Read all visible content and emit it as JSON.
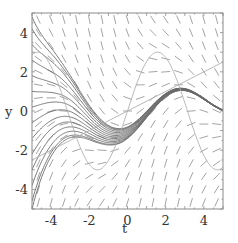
{
  "chart_data": {
    "type": "line",
    "title": "",
    "subtitle": "Direction field with solution curves",
    "xlabel": "t",
    "ylabel": "y",
    "xlim": [
      -5,
      5
    ],
    "ylim": [
      -5,
      5
    ],
    "x_ticks": [
      -4,
      -2,
      0,
      2,
      4
    ],
    "y_ticks": [
      -4,
      -2,
      0,
      2,
      4
    ],
    "x_tick_labels": [
      "-4",
      "-2",
      "0",
      "2",
      "4"
    ],
    "y_tick_labels": [
      "-4",
      "-2",
      "0",
      "2",
      "4"
    ],
    "grid": false,
    "legend": null,
    "series": [
      {
        "name": "line y = t/2",
        "kind": "curve",
        "x": [
          -5,
          5
        ],
        "y": [
          -2.5,
          2.5
        ]
      },
      {
        "name": "curve y = 3 sin(t)",
        "kind": "curve",
        "x": [
          -5,
          -4,
          -3,
          -2,
          -1.5,
          -1,
          0,
          1,
          1.5,
          2,
          3,
          4,
          5
        ],
        "y": [
          2.88,
          2.27,
          -0.42,
          -2.73,
          -2.99,
          -2.52,
          0,
          2.52,
          2.99,
          2.73,
          0.42,
          -2.27,
          -2.88
        ]
      },
      {
        "name": "solution curves",
        "kind": "integral-curves",
        "count": 14
      },
      {
        "name": "slope field",
        "kind": "direction-field",
        "grid": "15x15"
      }
    ]
  },
  "axes": {
    "x_label": "t",
    "y_label": "y"
  },
  "colors": {
    "frame": "#8a8a8a",
    "dash": "#9a9a9a",
    "curve": "#6a6a6a",
    "nullcline": "#b0b0b0",
    "text": "#333333"
  }
}
